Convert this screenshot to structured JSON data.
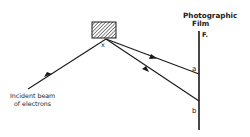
{
  "diagram": {
    "type": "electron-diffraction-schematic",
    "labels": {
      "film_title_line1": "Photographic",
      "film_title_line2": "Film",
      "film_marker": "F.",
      "crystal_point": "x",
      "point_a": "a",
      "point_b": "b",
      "incident_line1": "Incident  beam",
      "incident_line2": "of electrons"
    },
    "colors": {
      "stroke": "#1a1a1a",
      "background": "#ffffff",
      "hatch": "#333333"
    },
    "geometry": {
      "crystal_box": {
        "x": 92,
        "y": 22,
        "w": 24,
        "h": 16
      },
      "scatter_point": {
        "x": 106,
        "y": 39
      },
      "incident_start": {
        "x": 28,
        "y": 89
      },
      "film_line": {
        "x": 199,
        "y1": 31,
        "y2": 130
      },
      "point_a": {
        "x": 199,
        "y": 74
      },
      "point_b": {
        "x": 199,
        "y": 101
      }
    }
  }
}
